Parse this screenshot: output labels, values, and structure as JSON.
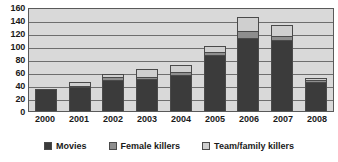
{
  "chart_data": {
    "type": "bar",
    "stacked": true,
    "title": "",
    "xlabel": "",
    "ylabel": "",
    "ylim": [
      0,
      160
    ],
    "ytick_step": 20,
    "yticks": [
      160,
      140,
      120,
      100,
      80,
      60,
      40,
      20,
      0
    ],
    "grid": true,
    "legend_position": "bottom",
    "categories": [
      "2000",
      "2001",
      "2002",
      "2003",
      "2004",
      "2005",
      "2006",
      "2007",
      "2008"
    ],
    "series": [
      {
        "name": "Movies",
        "color": "#3b3b3b",
        "values": [
          34,
          37,
          48,
          49,
          55,
          86,
          113,
          109,
          45
        ]
      },
      {
        "name": "Female killers",
        "color": "#8e8e8e",
        "values": [
          0,
          1,
          4,
          4,
          5,
          5,
          10,
          6,
          2
        ]
      },
      {
        "name": "Team/family killers",
        "color": "#cfcfcf",
        "values": [
          0,
          6,
          5,
          11,
          11,
          9,
          21,
          18,
          4
        ]
      }
    ],
    "totals": [
      34,
      44,
      57,
      64,
      71,
      100,
      144,
      133,
      51
    ]
  },
  "legend": {
    "items": [
      {
        "label": "Movies",
        "color": "#3b3b3b"
      },
      {
        "label": "Female killers",
        "color": "#8e8e8e"
      },
      {
        "label": "Team/family killers",
        "color": "#cfcfcf"
      }
    ]
  },
  "colors": {
    "plot_background": "#d9d9d9",
    "gridline": "#6e6e6e",
    "border": "#5a5a5a",
    "text": "#1a1a1a",
    "page_background": "#ffffff"
  }
}
